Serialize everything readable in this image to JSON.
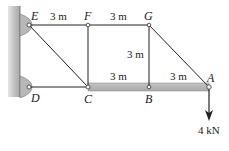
{
  "diagram": {
    "type": "truss",
    "nodes": [
      {
        "id": "E",
        "label": "E",
        "x": 29,
        "y": 25
      },
      {
        "id": "F",
        "label": "F",
        "x": 88,
        "y": 25
      },
      {
        "id": "G",
        "label": "G",
        "x": 149,
        "y": 25
      },
      {
        "id": "D",
        "label": "D",
        "x": 29,
        "y": 87
      },
      {
        "id": "C",
        "label": "C",
        "x": 88,
        "y": 87
      },
      {
        "id": "B",
        "label": "B",
        "x": 149,
        "y": 87
      },
      {
        "id": "A",
        "label": "A",
        "x": 209,
        "y": 87
      }
    ],
    "members": [
      [
        "E",
        "F"
      ],
      [
        "F",
        "G"
      ],
      [
        "E",
        "C"
      ],
      [
        "F",
        "C"
      ],
      [
        "G",
        "B"
      ],
      [
        "G",
        "A"
      ],
      [
        "D",
        "C"
      ]
    ],
    "beam": {
      "from": "C",
      "to": "A",
      "color": "#b5b5b5"
    },
    "supports": [
      {
        "node": "E",
        "type": "pin-wall"
      },
      {
        "node": "D",
        "type": "pin-wall"
      }
    ],
    "dimensions": [
      {
        "label": "3 m",
        "position": "EF"
      },
      {
        "label": "3 m",
        "position": "FG"
      },
      {
        "label": "3 m",
        "position": "GB"
      },
      {
        "label": "3 m",
        "position": "CB"
      },
      {
        "label": "3 m",
        "position": "BA"
      }
    ],
    "load": {
      "node": "A",
      "label": "4 kN",
      "direction": "down"
    }
  },
  "labels": {
    "E": "E",
    "F": "F",
    "G": "G",
    "D": "D",
    "C": "C",
    "B": "B",
    "A": "A",
    "dim_ef": "3 m",
    "dim_fg": "3 m",
    "dim_gb": "3 m",
    "dim_cb": "3 m",
    "dim_ba": "3 m",
    "load": "4 kN"
  }
}
